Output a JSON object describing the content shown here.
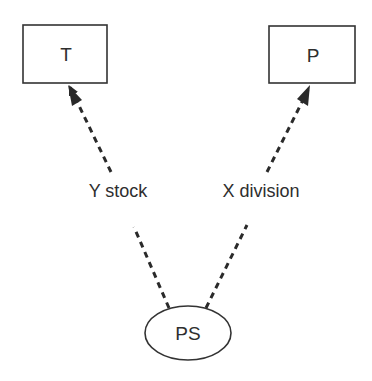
{
  "diagram": {
    "nodes": [
      {
        "id": "T",
        "label": "T",
        "shape": "rectangle"
      },
      {
        "id": "P",
        "label": "P",
        "shape": "rectangle"
      },
      {
        "id": "PS",
        "label": "PS",
        "shape": "ellipse"
      }
    ],
    "edges": [
      {
        "from": "PS",
        "to": "T",
        "label": "Y stock",
        "style": "dashed",
        "arrow": "to"
      },
      {
        "from": "PS",
        "to": "P",
        "label": "X division",
        "style": "dashed",
        "arrow": "to"
      }
    ],
    "colors": {
      "stroke": "#333333",
      "background": "#ffffff"
    }
  }
}
